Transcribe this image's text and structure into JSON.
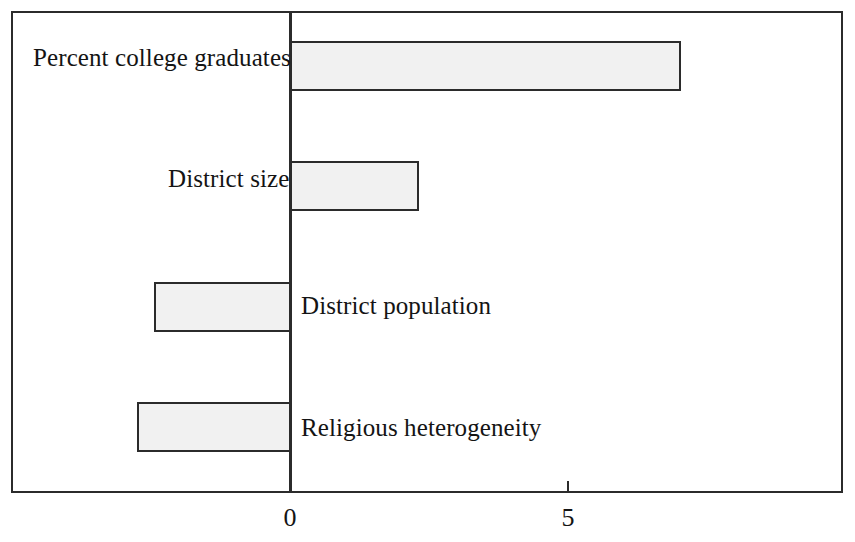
{
  "chart_data": {
    "type": "bar",
    "orientation": "horizontal",
    "title": "",
    "subtitle": "",
    "xlabel": "",
    "ylabel": "",
    "categories": [
      "Percent college graduates",
      "District size",
      "District population",
      "Religious heterogeneity"
    ],
    "values": [
      7.0,
      2.3,
      -2.45,
      -2.75
    ],
    "series": [
      {
        "name": "",
        "values": [
          7.0,
          2.3,
          -2.45,
          -2.75
        ]
      }
    ],
    "xlim": [
      -5.0,
      9.9
    ],
    "xticks": [
      0,
      5
    ],
    "xtick_labels": [
      "0",
      "5"
    ],
    "grid": false,
    "legend": false,
    "legend_position": "none",
    "bar_fill_color": "#f1f1f1",
    "bar_border_color": "#2b2b2b",
    "axis_color": "#2b2b2b",
    "background_color": "#ffffff",
    "bars": [
      {
        "label": "Percent college graduates",
        "value": 7.0,
        "label_side": "left",
        "left_px": 290,
        "width_px": 391,
        "top_px": 41,
        "height_px": 50,
        "label_x_px": 33,
        "label_y_px": 45
      },
      {
        "label": "District size",
        "value": 2.3,
        "label_side": "left",
        "left_px": 290,
        "width_px": 129,
        "top_px": 161,
        "height_px": 50,
        "label_x_px": 168,
        "label_y_px": 166
      },
      {
        "label": "District population",
        "value": -2.45,
        "label_side": "right",
        "left_px": 154,
        "width_px": 137,
        "top_px": 282,
        "height_px": 50,
        "label_x_px": 301,
        "label_y_px": 293
      },
      {
        "label": "Religious heterogeneity",
        "value": -2.75,
        "label_side": "right",
        "left_px": 137,
        "width_px": 154,
        "top_px": 402,
        "height_px": 50,
        "label_x_px": 301,
        "label_y_px": 415
      }
    ],
    "ticks": [
      {
        "label": "0",
        "x_px": 290,
        "label_x_px": 275,
        "mark_top_px": 470,
        "mark_height_px": 23
      },
      {
        "label": "5",
        "x_px": 568,
        "label_x_px": 553,
        "mark_top_px": 481,
        "mark_height_px": 12
      }
    ]
  },
  "axis": {
    "zero_line_x_px": 290
  }
}
